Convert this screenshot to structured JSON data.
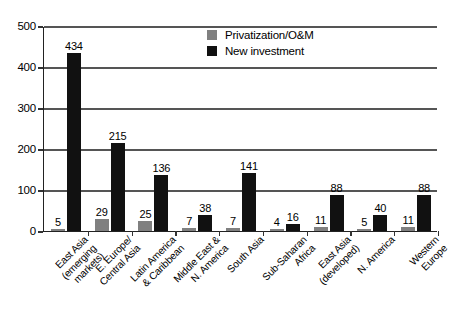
{
  "chart_data": {
    "type": "bar",
    "title": "",
    "subtitle": "",
    "xlabel": "",
    "ylabel": "",
    "ylim": [
      0,
      500
    ],
    "yticks": [
      0,
      100,
      200,
      300,
      400,
      500
    ],
    "grid": true,
    "legend_position": "top-center-right",
    "categories": [
      "East Asia (emerging markets)",
      "E. Europe/ Central Asia",
      "Latin America & Caribbean",
      "Middle East & N. America",
      "South Asia",
      "Sub-Saharan Africa",
      "East Asia (developed)",
      "N. America",
      "Western Europe"
    ],
    "category_lines": [
      [
        "East Asia",
        "(emerging",
        "markets)"
      ],
      [
        "E. Europe/",
        "Central Asia"
      ],
      [
        "Latin America",
        "& Caribbean"
      ],
      [
        "Middle East &",
        "N. America"
      ],
      [
        "South Asia"
      ],
      [
        "Sub-Saharan",
        "Africa"
      ],
      [
        "East Asia",
        "(developed)"
      ],
      [
        "N. America"
      ],
      [
        "Western",
        "Europe"
      ]
    ],
    "series": [
      {
        "name": "Privatization/O&M",
        "color": "#808080",
        "values": [
          5,
          29,
          25,
          7,
          7,
          4,
          11,
          5,
          11
        ]
      },
      {
        "name": "New investment",
        "color": "#111111",
        "values": [
          434,
          215,
          136,
          38,
          141,
          16,
          88,
          40,
          88
        ]
      }
    ]
  },
  "legend": {
    "items": [
      {
        "label": "Privatization/O&M",
        "color": "#808080"
      },
      {
        "label": "New investment",
        "color": "#111111"
      }
    ]
  }
}
